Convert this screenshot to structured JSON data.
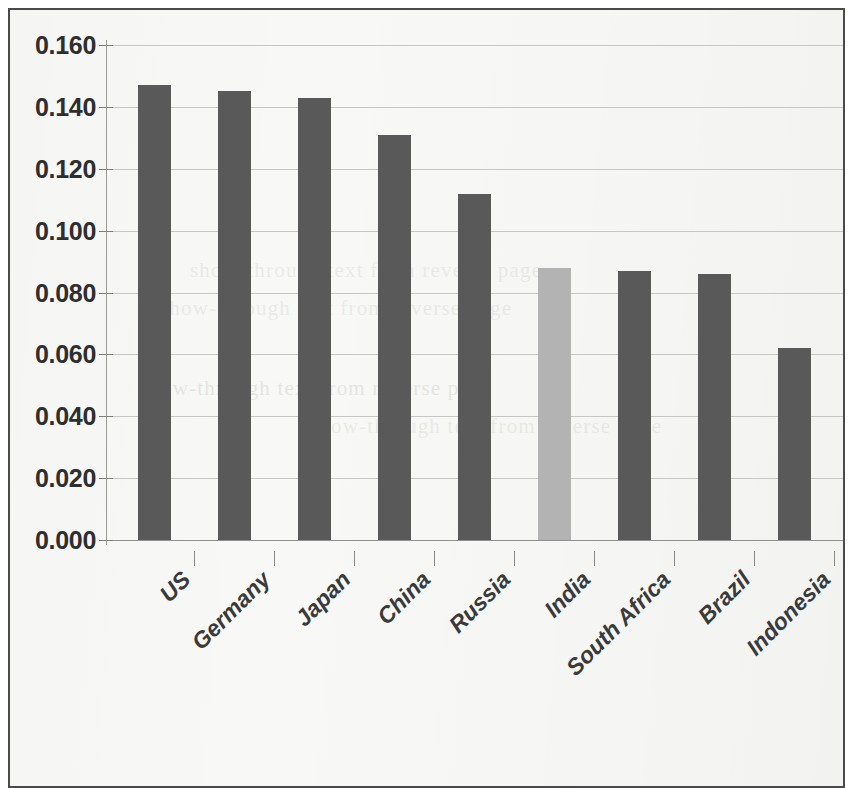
{
  "chart_data": {
    "type": "bar",
    "title": "",
    "subtitle": "",
    "xlabel": "",
    "ylabel": "",
    "categories": [
      "US",
      "Germany",
      "Japan",
      "China",
      "Russia",
      "India",
      "South Africa",
      "Brazil",
      "Indonesia"
    ],
    "values": [
      0.147,
      0.145,
      0.143,
      0.131,
      0.112,
      0.088,
      0.087,
      0.086,
      0.062
    ],
    "series": [
      {
        "name": "",
        "values": [
          0.147,
          0.145,
          0.143,
          0.131,
          0.112,
          0.088,
          0.087,
          0.086,
          0.062
        ]
      }
    ],
    "highlighted_category": "India",
    "highlight_index": 5,
    "ylim": [
      0.0,
      0.16
    ],
    "ytick_step": 0.02,
    "ytick_labels": [
      "0.160",
      "0.140",
      "0.120",
      "0.100",
      "0.080",
      "0.060",
      "0.040",
      "0.020",
      "0.000"
    ],
    "ytick_values": [
      0.16,
      0.14,
      0.12,
      0.1,
      0.08,
      0.06,
      0.04,
      0.02,
      0.0
    ],
    "grid": true,
    "grid_axis": "y",
    "legend": false,
    "legend_position": "none",
    "annotations": [],
    "colors": {
      "bar_default": "#595959",
      "bar_highlight": "#b3b3b3",
      "gridline": "#c6c6c6",
      "axis": "#9a9a9a",
      "label_text": "#2e2e2e",
      "category_text": "#3a3a3a",
      "plot_background": "#f8f8f6",
      "frame_border": "#4a4a4a"
    }
  },
  "figure": {
    "frame_visible": true,
    "background_artifacts": [
      "show-through text from reverse page",
      "show-through text from reverse page",
      "show-through text from reverse page",
      "show-through text from reverse page"
    ]
  }
}
